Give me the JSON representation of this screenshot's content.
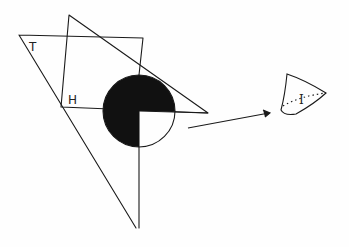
{
  "diagram": {
    "type": "hand-drawn geometric sketch",
    "labels": {
      "t": "T",
      "h": "H",
      "i": "I"
    },
    "shapes": [
      {
        "name": "left-triangle",
        "points": [
          [
            19,
            35
          ],
          [
            143,
            38
          ],
          [
            136,
            228
          ]
        ]
      },
      {
        "name": "upper-triangle",
        "points": [
          [
            69,
            15
          ],
          [
            208,
            113
          ],
          [
            61,
            107
          ]
        ]
      },
      {
        "name": "circle-quadrant-cut",
        "center": [
          139,
          111
        ],
        "radius": 36,
        "filled_fraction": 0.75
      },
      {
        "name": "arrow",
        "from": [
          188,
          128
        ],
        "to": [
          270,
          113
        ]
      },
      {
        "name": "cone-piece",
        "label": "I"
      }
    ],
    "colors": {
      "ink": "#1a1a1a",
      "paper": "#fefefe"
    }
  }
}
